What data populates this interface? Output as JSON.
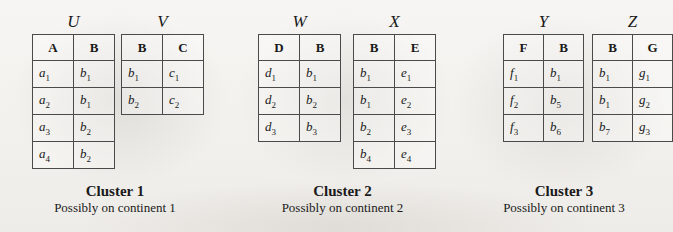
{
  "figure": {
    "background_color": "#f3f2ef",
    "ink_color": "#1a1a1a"
  },
  "clusters": [
    {
      "caption_title": "Cluster 1",
      "caption_sub": "Possibly on continent 1",
      "tables": [
        {
          "label": "U",
          "columns": [
            "A",
            "B"
          ],
          "rows": [
            [
              {
                "base": "a",
                "sub": "1"
              },
              {
                "base": "b",
                "sub": "1"
              }
            ],
            [
              {
                "base": "a",
                "sub": "2"
              },
              {
                "base": "b",
                "sub": "1"
              }
            ],
            [
              {
                "base": "a",
                "sub": "3"
              },
              {
                "base": "b",
                "sub": "2"
              }
            ],
            [
              {
                "base": "a",
                "sub": "4"
              },
              {
                "base": "b",
                "sub": "2"
              }
            ]
          ]
        },
        {
          "label": "V",
          "columns": [
            "B",
            "C"
          ],
          "rows": [
            [
              {
                "base": "b",
                "sub": "1"
              },
              {
                "base": "c",
                "sub": "1"
              }
            ],
            [
              {
                "base": "b",
                "sub": "2"
              },
              {
                "base": "c",
                "sub": "2"
              }
            ]
          ]
        }
      ]
    },
    {
      "caption_title": "Cluster 2",
      "caption_sub": "Possibly on continent 2",
      "tables": [
        {
          "label": "W",
          "columns": [
            "D",
            "B"
          ],
          "rows": [
            [
              {
                "base": "d",
                "sub": "1"
              },
              {
                "base": "b",
                "sub": "1"
              }
            ],
            [
              {
                "base": "d",
                "sub": "2"
              },
              {
                "base": "b",
                "sub": "2"
              }
            ],
            [
              {
                "base": "d",
                "sub": "3"
              },
              {
                "base": "b",
                "sub": "3"
              }
            ]
          ]
        },
        {
          "label": "X",
          "columns": [
            "B",
            "E"
          ],
          "rows": [
            [
              {
                "base": "b",
                "sub": "1"
              },
              {
                "base": "e",
                "sub": "1"
              }
            ],
            [
              {
                "base": "b",
                "sub": "1"
              },
              {
                "base": "e",
                "sub": "2"
              }
            ],
            [
              {
                "base": "b",
                "sub": "2"
              },
              {
                "base": "e",
                "sub": "3"
              }
            ],
            [
              {
                "base": "b",
                "sub": "4"
              },
              {
                "base": "e",
                "sub": "4"
              }
            ]
          ]
        }
      ]
    },
    {
      "caption_title": "Cluster 3",
      "caption_sub": "Possibly on continent 3",
      "tables": [
        {
          "label": "Y",
          "columns": [
            "F",
            "B"
          ],
          "rows": [
            [
              {
                "base": "f",
                "sub": "1"
              },
              {
                "base": "b",
                "sub": "1"
              }
            ],
            [
              {
                "base": "f",
                "sub": "2"
              },
              {
                "base": "b",
                "sub": "5"
              }
            ],
            [
              {
                "base": "f",
                "sub": "3"
              },
              {
                "base": "b",
                "sub": "6"
              }
            ]
          ]
        },
        {
          "label": "Z",
          "columns": [
            "B",
            "G"
          ],
          "rows": [
            [
              {
                "base": "b",
                "sub": "1"
              },
              {
                "base": "g",
                "sub": "1"
              }
            ],
            [
              {
                "base": "b",
                "sub": "1"
              },
              {
                "base": "g",
                "sub": "2"
              }
            ],
            [
              {
                "base": "b",
                "sub": "7"
              },
              {
                "base": "g",
                "sub": "3"
              }
            ]
          ]
        }
      ]
    }
  ]
}
